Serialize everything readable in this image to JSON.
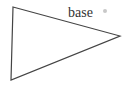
{
  "diagram": {
    "shape": "triangle",
    "vertices": [
      {
        "name": "top-left",
        "x": 13,
        "y": 7
      },
      {
        "name": "right",
        "x": 120,
        "y": 36
      },
      {
        "name": "bottom-left",
        "x": 11,
        "y": 80
      }
    ],
    "stroke_color": "#444444",
    "fill_color": "#ffffff",
    "labels": {
      "base": "base"
    },
    "mark_color": "#c8c8c8"
  }
}
